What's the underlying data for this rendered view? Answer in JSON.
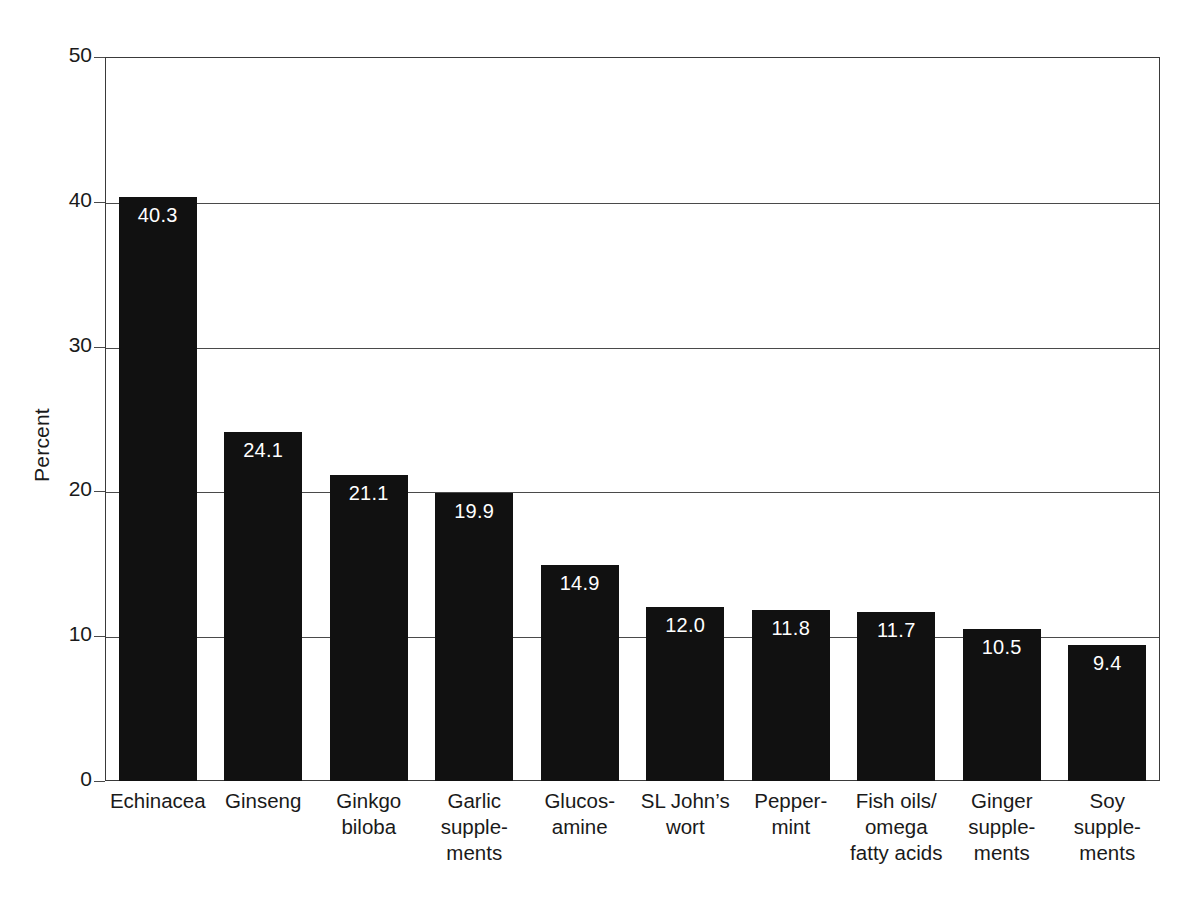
{
  "chart_data": {
    "type": "bar",
    "title": "",
    "subtitle": "",
    "xlabel": "",
    "ylabel": "Percent",
    "ylim": [
      0,
      50
    ],
    "yticks": [
      0,
      10,
      20,
      30,
      40,
      50
    ],
    "ytick_labels": [
      "0",
      "10",
      "20",
      "30",
      "40",
      "50"
    ],
    "grid": true,
    "grid_axis": "y",
    "legend": false,
    "legend_position": "none",
    "bar_color": "#111111",
    "bar_label_color": "#ffffff",
    "axis_color": "#3a3a3a",
    "background_color": "#ffffff",
    "categories": [
      "Echinacea",
      "Ginseng",
      "Ginkgo\nbiloba",
      "Garlic\nsupple-\nments",
      "Glucos-\namine",
      "SL John’s\nwort",
      "Pepper-\nmint",
      "Fish oils/\nomega\nfatty acids",
      "Ginger\nsupple-\nments",
      "Soy\nsupple-\nments"
    ],
    "values": [
      40.3,
      24.1,
      21.1,
      19.9,
      14.9,
      12.0,
      11.8,
      11.7,
      10.5,
      9.4
    ],
    "data_labels": [
      "40.3",
      "24.1",
      "21.1",
      "19.9",
      "14.9",
      "12.0",
      "11.8",
      "11.7",
      "10.5",
      "9.4"
    ]
  }
}
